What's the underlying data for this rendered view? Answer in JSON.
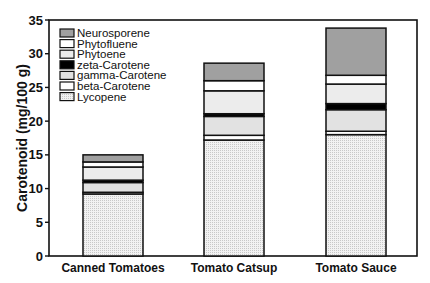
{
  "chart_data": {
    "type": "bar",
    "stacked": true,
    "title": "",
    "xlabel": "",
    "ylabel": "Carotenoid (mg/100 g)",
    "ylim": [
      0,
      35
    ],
    "yticks": [
      0,
      5,
      10,
      15,
      20,
      25,
      30,
      35
    ],
    "grid": false,
    "legend_position": "upper-left",
    "categories": [
      "Canned Tomatoes",
      "Tomato Catsup",
      "Tomato Sauce"
    ],
    "series": [
      {
        "name": "Lycopene",
        "color": "#e6e6e6",
        "pattern": "dots",
        "values": [
          9.2,
          17.2,
          18.0
        ]
      },
      {
        "name": "beta-Carotene",
        "color": "#ffffff",
        "pattern": "none",
        "values": [
          0.25,
          0.7,
          0.5
        ]
      },
      {
        "name": "gamma-Carotene",
        "color": "#e2e2e2",
        "pattern": "none",
        "values": [
          1.45,
          2.8,
          3.2
        ]
      },
      {
        "name": "zeta-Carotene",
        "color": "#000000",
        "pattern": "none",
        "values": [
          0.35,
          0.4,
          0.9
        ]
      },
      {
        "name": "Phytoene",
        "color": "#ececec",
        "pattern": "none",
        "values": [
          1.95,
          3.4,
          2.9
        ]
      },
      {
        "name": "Phytofluene",
        "color": "#ffffff",
        "pattern": "none",
        "values": [
          0.75,
          1.5,
          1.3
        ]
      },
      {
        "name": "Neurosporene",
        "color": "#a0a0a0",
        "pattern": "none",
        "values": [
          1.05,
          2.6,
          7.0
        ]
      }
    ],
    "totals": [
      15.0,
      28.6,
      33.8
    ],
    "legend_order": [
      "Neurosporene",
      "Phytofluene",
      "Phytoene",
      "zeta-Carotene",
      "gamma-Carotene",
      "beta-Carotene",
      "Lycopene"
    ]
  }
}
